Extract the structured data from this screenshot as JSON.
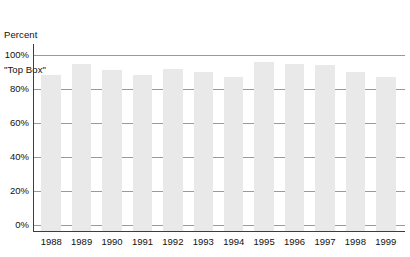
{
  "chart_data": {
    "type": "bar",
    "title": "Percent \"Top Box\"",
    "title_line1": "Percent",
    "title_line2": "\"Top Box\"",
    "xlabel": "",
    "ylabel": "Percent \"Top Box\"",
    "categories": [
      "1988",
      "1989",
      "1990",
      "1991",
      "1992",
      "1993",
      "1994",
      "1995",
      "1996",
      "1997",
      "1998",
      "1999"
    ],
    "values": [
      88,
      95,
      91,
      88,
      92,
      90,
      87,
      96,
      95,
      94,
      90,
      87
    ],
    "ylim": [
      0,
      100
    ],
    "yticks": [
      0,
      20,
      40,
      60,
      80,
      100
    ],
    "ytick_labels": [
      "0%",
      "20%",
      "40%",
      "60%",
      "80%",
      "100%"
    ],
    "grid": true,
    "grid_axis": "y",
    "legend": false,
    "legend_position": "none",
    "bar_color": "#e9e9e9",
    "grid_color": "#9a9a9a",
    "axis_color": "#3d3d3d",
    "background_color": "#ffffff"
  }
}
